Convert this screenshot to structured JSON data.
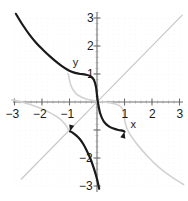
{
  "chart_data": {
    "type": "line",
    "title": "",
    "xlabel": "x",
    "ylabel": "y",
    "xlim": [
      -3.2,
      3.2
    ],
    "ylim": [
      -3.2,
      3.2
    ],
    "grid": true,
    "grid_style": "dotted-minor",
    "legend": "none",
    "x_ticks": [
      -3,
      -2,
      -1,
      1,
      2,
      3
    ],
    "y_ticks": [
      3,
      2,
      1,
      -2,
      -3
    ],
    "x_tick_labels": [
      "−3",
      "−2",
      "−1",
      "1",
      "2",
      "3"
    ],
    "y_tick_labels": [
      "3",
      "2",
      "1",
      "−2",
      "−3"
    ],
    "series": [
      {
        "name": "function",
        "color": "#1a1a1a",
        "width": 2.2,
        "style": "solid",
        "points": [
          [
            -2.95,
            3.15
          ],
          [
            -2.7,
            2.75
          ],
          [
            -2.45,
            2.4
          ],
          [
            -2.2,
            2.1
          ],
          [
            -1.95,
            1.85
          ],
          [
            -1.7,
            1.62
          ],
          [
            -1.5,
            1.45
          ],
          [
            -1.3,
            1.3
          ],
          [
            -1.1,
            1.17
          ],
          [
            -0.92,
            1.08
          ],
          [
            -0.75,
            1.03
          ],
          [
            -0.6,
            1.0
          ],
          [
            -0.42,
            0.98
          ],
          [
            -0.25,
            0.93
          ],
          [
            -0.12,
            0.8
          ],
          [
            -0.04,
            0.55
          ],
          [
            0.0,
            0.25
          ],
          [
            0.04,
            -0.05
          ],
          [
            0.12,
            -0.42
          ],
          [
            0.25,
            -0.7
          ],
          [
            0.42,
            -0.86
          ],
          [
            0.6,
            -0.95
          ],
          [
            0.78,
            -1.0
          ],
          [
            0.95,
            -1.03
          ],
          [
            1.0,
            -1.06
          ]
        ]
      },
      {
        "name": "function-lower-branch",
        "color": "#1a1a1a",
        "width": 2.2,
        "style": "solid",
        "points": [
          [
            -0.98,
            -1.05
          ],
          [
            -0.88,
            -1.1
          ],
          [
            -0.75,
            -1.2
          ],
          [
            -0.62,
            -1.33
          ],
          [
            -0.5,
            -1.5
          ],
          [
            -0.38,
            -1.72
          ],
          [
            -0.25,
            -2.0
          ],
          [
            -0.12,
            -2.35
          ],
          [
            0.0,
            -2.75
          ],
          [
            0.08,
            -3.1
          ]
        ]
      },
      {
        "name": "inverse-reflection",
        "color": "#d2d2d2",
        "width": 1.6,
        "style": "solid",
        "points": [
          [
            3.15,
            -2.95
          ],
          [
            2.75,
            -2.7
          ],
          [
            2.4,
            -2.45
          ],
          [
            2.1,
            -2.2
          ],
          [
            1.85,
            -1.95
          ],
          [
            1.62,
            -1.7
          ],
          [
            1.45,
            -1.5
          ],
          [
            1.3,
            -1.3
          ],
          [
            1.17,
            -1.1
          ],
          [
            1.08,
            -0.92
          ],
          [
            1.03,
            -0.75
          ],
          [
            1.0,
            -0.6
          ],
          [
            0.98,
            -0.42
          ],
          [
            0.93,
            -0.25
          ],
          [
            0.8,
            -0.12
          ],
          [
            0.55,
            -0.04
          ],
          [
            0.25,
            0.0
          ],
          [
            -0.05,
            0.04
          ],
          [
            -0.42,
            0.12
          ],
          [
            -0.7,
            0.25
          ],
          [
            -0.86,
            0.42
          ],
          [
            -0.95,
            0.6
          ],
          [
            -1.0,
            0.78
          ],
          [
            -1.03,
            0.95
          ],
          [
            -1.06,
            1.0
          ]
        ]
      },
      {
        "name": "inverse-reflection-lower-branch",
        "color": "#d2d2d2",
        "width": 1.6,
        "style": "solid",
        "points": [
          [
            -1.05,
            -0.98
          ],
          [
            -1.1,
            -0.88
          ],
          [
            -1.2,
            -0.75
          ],
          [
            -1.33,
            -0.62
          ],
          [
            -1.5,
            -0.5
          ],
          [
            -1.72,
            -0.38
          ],
          [
            -2.0,
            -0.25
          ],
          [
            -2.35,
            -0.12
          ],
          [
            -2.75,
            0.0
          ],
          [
            -3.1,
            0.08
          ]
        ]
      },
      {
        "name": "identity-line",
        "color": "#c8c8c8",
        "width": 1.2,
        "style": "solid",
        "points": [
          [
            -2.75,
            -2.75
          ],
          [
            3.1,
            3.1
          ]
        ]
      }
    ],
    "annotations": [
      {
        "name": "x-axis-name",
        "text": "x",
        "x": 1.22,
        "y": -0.62
      },
      {
        "name": "y-axis-name",
        "text": "y",
        "x": -0.88,
        "y": 1.62
      }
    ],
    "arrow_markers": [
      {
        "name": "curve-arrow-right",
        "x": 1.0,
        "y": -1.06,
        "angle": -75
      },
      {
        "name": "curve-arrow-left",
        "x": -0.98,
        "y": -1.05,
        "angle": 105
      }
    ]
  },
  "colors": {
    "axis": "#6e6e6e",
    "grid_minor": "#cfcfcf",
    "curve": "#1a1a1a",
    "reflection": "#d2d2d2",
    "identity": "#c8c8c8",
    "text": "#1a1a1a",
    "background": "#ffffff"
  }
}
